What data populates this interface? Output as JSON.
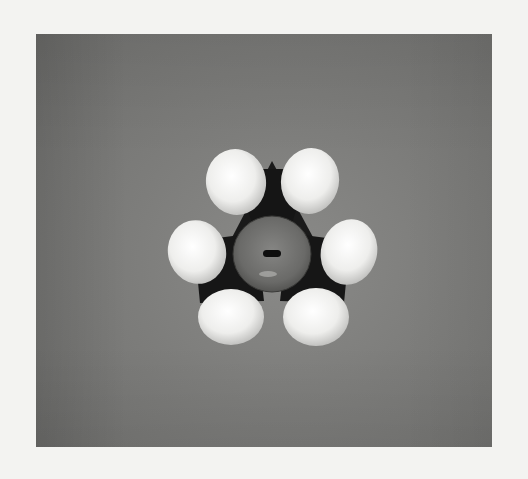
{
  "image": {
    "subject": "space-filling molecular model viewed from above",
    "description": "Dark central carbon framework with six white hydrogen spheres arranged in three pairs around a translucent central atom with a small slot",
    "colors": {
      "page_background": "#f3f3f1",
      "photo_background": "#7d7d7b",
      "hydrogen_spheres": "#ececea",
      "carbon_framework": "#1c1c1c",
      "central_atom": "#6e6e6c"
    }
  }
}
